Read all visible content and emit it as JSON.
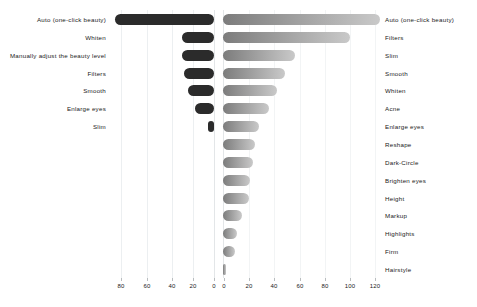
{
  "chart_data": {
    "type": "bar",
    "title": "",
    "subtitle": "",
    "orientation": "horizontal",
    "layout": "diverging-dual-axis",
    "xlabel": "",
    "ylabel": "",
    "grid": true,
    "legend": "none",
    "left_axis": {
      "name": "left",
      "ticks": [
        80,
        60,
        40,
        20,
        0
      ],
      "tick_labels": [
        "80",
        "60",
        "40",
        "20",
        "0"
      ],
      "max": 90,
      "direction": "right-to-left"
    },
    "right_axis": {
      "name": "right",
      "ticks": [
        0,
        20,
        40,
        60,
        80,
        100,
        120
      ],
      "tick_labels": [
        "0",
        "20",
        "40",
        "60",
        "80",
        "100",
        "120"
      ],
      "max": 130,
      "direction": "left-to-right"
    },
    "left_series": {
      "name": "left-bars",
      "color": "#2b2b2b",
      "categories": [
        "Auto (one-click beauty)",
        "Whiten",
        "Manually adjust the beauty level",
        "Filters",
        "Smooth",
        "Enlarge eyes",
        "Slim"
      ],
      "values": [
        77,
        25,
        25,
        23,
        20,
        15,
        5
      ]
    },
    "right_series": {
      "name": "right-bars",
      "color_start": "#7c7c7c",
      "color_end": "#c9c9c9",
      "categories": [
        "Auto (one-click beauty)",
        "Filters",
        "Slim",
        "Smooth",
        "Whiten",
        "Acne",
        "Enlarge eyes",
        "Reshape",
        "Dark-Circle",
        "Brighten eyes",
        "Height",
        "Markup",
        "Highlights",
        "Firm",
        "Hairstyle"
      ],
      "values": [
        122,
        99,
        56,
        48,
        42,
        36,
        28,
        25,
        23,
        21,
        20,
        15,
        11,
        9,
        2
      ]
    }
  },
  "axis": {
    "left_ticks": [
      {
        "label": "80",
        "x": 121
      },
      {
        "label": "60",
        "x": 147
      },
      {
        "label": "40",
        "x": 172
      },
      {
        "label": "20",
        "x": 193
      },
      {
        "label": "0",
        "x": 214
      }
    ],
    "right_ticks": [
      {
        "label": "0",
        "x": 224
      },
      {
        "label": "20",
        "x": 249
      },
      {
        "label": "40",
        "x": 274
      },
      {
        "label": "60",
        "x": 300
      },
      {
        "label": "80",
        "x": 325
      },
      {
        "label": "100",
        "x": 350
      },
      {
        "label": "120",
        "x": 375
      }
    ]
  }
}
